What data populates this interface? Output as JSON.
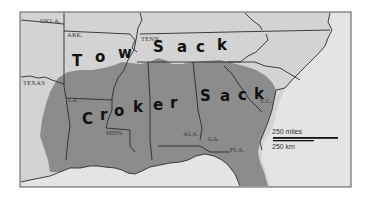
{
  "map": {
    "title_words": {
      "tow_sack": [
        "T",
        "o",
        "w",
        "S",
        "a",
        "c",
        "k"
      ],
      "croker_sack": [
        "C",
        "r",
        "o",
        "k",
        "e",
        "r",
        "S",
        "a",
        "c",
        "k"
      ]
    },
    "state_labels": {
      "okla": "OKLA.",
      "ark": "ARK.",
      "tenn": "TENN.",
      "texas": "TEXAS",
      "la": "LA.",
      "miss": "MISS.",
      "ala": "ALA.",
      "ga": "GA.",
      "fla": "FLA.",
      "sc": "S.C."
    },
    "scale": {
      "miles_label": "250 miles",
      "km_label": "250 km"
    },
    "colors": {
      "land": "#d3d3d3",
      "shaded_region": "#8c8c8c",
      "water": "#e4e4e4",
      "border": "#2b2b2b"
    }
  }
}
